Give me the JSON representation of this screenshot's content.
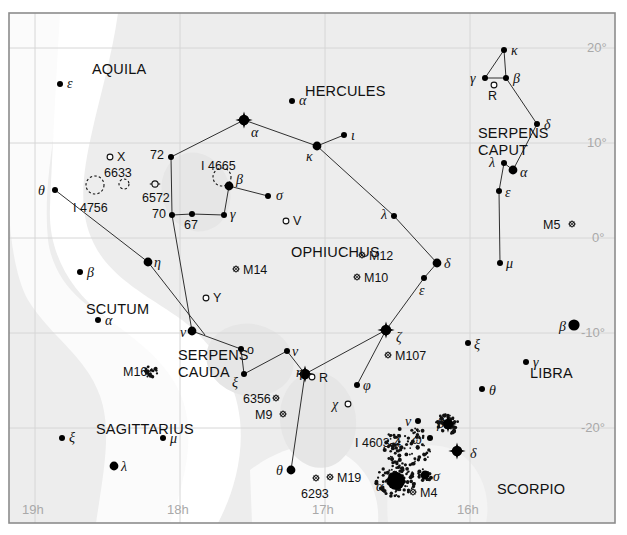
{
  "chart_data": {
    "type": "scatter",
    "xlabel": "Right Ascension",
    "ylabel": "Declination",
    "xlim": [
      19.4,
      15.55
    ],
    "ylim": [
      -24,
      23
    ],
    "grid": true,
    "legend": "none",
    "ra_ticks": [
      "19h",
      "18h",
      "17h",
      "16h"
    ],
    "ra_tick_values": [
      19,
      18,
      17,
      16
    ],
    "dec_ticks": [
      "20°",
      "10°",
      "0°",
      "-10°",
      "-20°"
    ],
    "dec_tick_values": [
      20,
      10,
      0,
      -10,
      -20
    ],
    "constellation_names": [
      {
        "name": "AQUILA",
        "x": 92,
        "y": 62
      },
      {
        "name": "HERCULES",
        "x": 305,
        "y": 84
      },
      {
        "name": "SERPENS",
        "x": 478,
        "y": 126
      },
      {
        "name": "CAPUT",
        "x": 478,
        "y": 143
      },
      {
        "name": "OPHIUCHUS",
        "x": 291,
        "y": 245
      },
      {
        "name": "SCUTUM",
        "x": 86,
        "y": 302
      },
      {
        "name": "SERPENS",
        "x": 178,
        "y": 348
      },
      {
        "name": "CAUDA",
        "x": 178,
        "y": 365
      },
      {
        "name": "SAGITTARIUS",
        "x": 96,
        "y": 422
      },
      {
        "name": "LIBRA",
        "x": 530,
        "y": 366
      },
      {
        "name": "SCORPIO",
        "x": 497,
        "y": 482
      }
    ],
    "stars": [
      {
        "label": "ε",
        "const": "Aquila",
        "x": 60,
        "y": 84,
        "mag": 3.0,
        "style": "dot",
        "lx": 67,
        "ly": 77,
        "type": "greek"
      },
      {
        "label": "α",
        "const": "Hercules",
        "x": 292,
        "y": 101,
        "mag": 3.0,
        "style": "dot",
        "lx": 299,
        "ly": 94,
        "type": "greek"
      },
      {
        "label": "α",
        "const": "Ophiuchus",
        "x": 244,
        "y": 120,
        "mag": 2.1,
        "style": "bright",
        "lx": 251,
        "ly": 126,
        "type": "greek"
      },
      {
        "label": "κ",
        "const": "Ophiuchus",
        "x": 317,
        "y": 146,
        "mag": 3.2,
        "style": "med",
        "lx": 306,
        "ly": 150,
        "type": "greek"
      },
      {
        "label": "ι",
        "const": "Ophiuchus",
        "x": 344,
        "y": 135,
        "mag": 3.5,
        "style": "dot",
        "lx": 351,
        "ly": 129,
        "type": "greek"
      },
      {
        "label": "72",
        "const": "Ophiuchus",
        "x": 171,
        "y": 157,
        "mag": 4.0,
        "style": "dot",
        "lx": 150,
        "ly": 149,
        "type": "num"
      },
      {
        "label": "β",
        "const": "Ophiuchus",
        "x": 229,
        "y": 186,
        "mag": 2.8,
        "style": "med",
        "lx": 236,
        "ly": 173,
        "type": "greek"
      },
      {
        "label": "σ",
        "const": "Ophiuchus",
        "x": 268,
        "y": 196,
        "mag": 4.3,
        "style": "dot",
        "lx": 276,
        "ly": 189,
        "type": "greek"
      },
      {
        "label": "γ",
        "const": "Ophiuchus",
        "x": 224,
        "y": 215,
        "mag": 3.7,
        "style": "dot",
        "lx": 230,
        "ly": 208,
        "type": "greek"
      },
      {
        "label": "70",
        "const": "Ophiuchus",
        "x": 172,
        "y": 215,
        "mag": 4.0,
        "style": "dot",
        "lx": 152,
        "ly": 208,
        "type": "num"
      },
      {
        "label": "67",
        "const": "Ophiuchus",
        "x": 192,
        "y": 214,
        "mag": 4.0,
        "style": "dot",
        "lx": 184,
        "ly": 219,
        "type": "num"
      },
      {
        "label": "θ",
        "const": "Serpens",
        "x": 55,
        "y": 190,
        "mag": 4.0,
        "style": "dot",
        "lx": 38,
        "ly": 184,
        "type": "greek"
      },
      {
        "label": "λ",
        "const": "Ophiuchus",
        "x": 394,
        "y": 216,
        "mag": 3.8,
        "style": "dot",
        "lx": 381,
        "ly": 208,
        "type": "greek"
      },
      {
        "label": "δ",
        "const": "Ophiuchus",
        "x": 437,
        "y": 263,
        "mag": 2.7,
        "style": "med",
        "lx": 444,
        "ly": 257,
        "type": "greek"
      },
      {
        "label": "ε",
        "const": "Ophiuchus",
        "x": 424,
        "y": 278,
        "mag": 3.2,
        "style": "dot",
        "lx": 419,
        "ly": 284,
        "type": "greek"
      },
      {
        "label": "ζ",
        "const": "Ophiuchus",
        "x": 386,
        "y": 330,
        "mag": 2.5,
        "style": "bright",
        "lx": 396,
        "ly": 331,
        "type": "greek"
      },
      {
        "label": "η",
        "const": "Ophiuchus",
        "x": 148,
        "y": 262,
        "mag": 3.0,
        "style": "med",
        "lx": 154,
        "ly": 256,
        "type": "greek"
      },
      {
        "label": "ν",
        "const": "Serpens",
        "x": 192,
        "y": 331,
        "mag": 3.0,
        "style": "med",
        "lx": 180,
        "ly": 326,
        "type": "greek"
      },
      {
        "label": "o",
        "const": "Serpens",
        "x": 241,
        "y": 349,
        "mag": 4.2,
        "style": "dot",
        "lx": 247,
        "ly": 344,
        "type": "plain"
      },
      {
        "label": "ν",
        "const": "Serpens2",
        "x": 287,
        "y": 351,
        "mag": 4.2,
        "style": "dot",
        "lx": 292,
        "ly": 345,
        "type": "greek"
      },
      {
        "label": "ξ",
        "const": "Serpens",
        "x": 244,
        "y": 374,
        "mag": 3.5,
        "style": "dot",
        "lx": 232,
        "ly": 376,
        "type": "greek"
      },
      {
        "label": "η",
        "const": "Serpens-eta",
        "x": 305,
        "y": 374,
        "mag": 2.4,
        "style": "bright",
        "lx": 296,
        "ly": 366,
        "type": "greek"
      },
      {
        "label": "β",
        "const": "Scutum",
        "x": 80,
        "y": 272,
        "mag": 4.2,
        "style": "dot",
        "lx": 87,
        "ly": 266,
        "type": "greek"
      },
      {
        "label": "α",
        "const": "Scutum",
        "x": 98,
        "y": 320,
        "mag": 3.8,
        "style": "dot",
        "lx": 105,
        "ly": 314,
        "type": "greek"
      },
      {
        "label": "ξ",
        "const": "Sagittarius",
        "x": 62,
        "y": 438,
        "mag": 3.5,
        "style": "dot",
        "lx": 69,
        "ly": 431,
        "type": "greek"
      },
      {
        "label": "μ",
        "const": "Sagittarius",
        "x": 163,
        "y": 438,
        "mag": 3.8,
        "style": "dot",
        "lx": 170,
        "ly": 432,
        "type": "greek"
      },
      {
        "label": "λ",
        "const": "Sagittarius",
        "x": 114,
        "y": 466,
        "mag": 2.8,
        "style": "med",
        "lx": 121,
        "ly": 460,
        "type": "greek"
      },
      {
        "label": "θ",
        "const": "Ophiuchus-th",
        "x": 291,
        "y": 470,
        "mag": 3.3,
        "style": "med",
        "lx": 276,
        "ly": 464,
        "type": "greek"
      },
      {
        "label": "φ",
        "const": "Ophiuchus-phi",
        "x": 357,
        "y": 385,
        "mag": 4.3,
        "style": "dot",
        "lx": 363,
        "ly": 379,
        "type": "greek"
      },
      {
        "label": "χ",
        "const": "Ophiuchus-chi",
        "x": 348,
        "y": 404,
        "mag": 4.4,
        "style": "open",
        "lx": 332,
        "ly": 398,
        "type": "greek"
      },
      {
        "label": "κ",
        "const": "Serpens Caput",
        "x": 504,
        "y": 50,
        "mag": 4.1,
        "style": "dot",
        "lx": 511,
        "ly": 44,
        "type": "greek"
      },
      {
        "label": "γ",
        "const": "Serpens Caput",
        "x": 485,
        "y": 78,
        "mag": 3.8,
        "style": "dot",
        "lx": 470,
        "ly": 72,
        "type": "greek"
      },
      {
        "label": "β",
        "const": "Serpens Caput",
        "x": 506,
        "y": 78,
        "mag": 3.7,
        "style": "dot",
        "lx": 513,
        "ly": 72,
        "type": "greek"
      },
      {
        "label": "R",
        "const": "Serpens Caput",
        "x": 494,
        "y": 85,
        "mag": 5.0,
        "style": "open",
        "lx": 488,
        "ly": 90,
        "type": "plain"
      },
      {
        "label": "δ",
        "const": "Serpens Caput",
        "x": 537,
        "y": 124,
        "mag": 3.8,
        "style": "dot",
        "lx": 544,
        "ly": 118,
        "type": "greek"
      },
      {
        "label": "λ",
        "const": "Serpens Caput",
        "x": 504,
        "y": 163,
        "mag": 4.4,
        "style": "dot",
        "lx": 489,
        "ly": 156,
        "type": "greek"
      },
      {
        "label": "α",
        "const": "Serpens Caput",
        "x": 513,
        "y": 170,
        "mag": 2.6,
        "style": "med",
        "lx": 520,
        "ly": 166,
        "type": "greek"
      },
      {
        "label": "ε",
        "const": "Serpens Caput",
        "x": 499,
        "y": 191,
        "mag": 3.7,
        "style": "dot",
        "lx": 505,
        "ly": 186,
        "type": "greek"
      },
      {
        "label": "μ",
        "const": "Serpens Caput",
        "x": 500,
        "y": 263,
        "mag": 3.5,
        "style": "dot",
        "lx": 506,
        "ly": 257,
        "type": "greek"
      },
      {
        "label": "β",
        "const": "Libra",
        "x": 574,
        "y": 325,
        "mag": 2.6,
        "style": "big",
        "lx": 559,
        "ly": 320,
        "type": "greek"
      },
      {
        "label": "ξ",
        "const": "Libra-xi",
        "x": 468,
        "y": 343,
        "mag": 4.4,
        "style": "dot",
        "lx": 474,
        "ly": 338,
        "type": "greek"
      },
      {
        "label": "γ",
        "const": "Libra",
        "x": 526,
        "y": 362,
        "mag": 3.9,
        "style": "dot",
        "lx": 533,
        "ly": 356,
        "type": "greek"
      },
      {
        "label": "θ",
        "const": "Libra-theta",
        "x": 482,
        "y": 389,
        "mag": 4.1,
        "style": "dot",
        "lx": 489,
        "ly": 384,
        "type": "greek"
      },
      {
        "label": "ν",
        "const": "Scorpio",
        "x": 418,
        "y": 421,
        "mag": 4.0,
        "style": "dot",
        "lx": 405,
        "ly": 415,
        "type": "greek"
      },
      {
        "label": "β",
        "const": "Scorpio-beta",
        "x": 448,
        "y": 424,
        "mag": 2.6,
        "style": "bright",
        "lx": 455,
        "ly": 418,
        "type": "none"
      },
      {
        "label": "ω",
        "const": "Scorpio",
        "x": 430,
        "y": 438,
        "mag": 4.0,
        "style": "dot",
        "lx": 412,
        "ly": 433,
        "type": "greek"
      },
      {
        "label": "δ",
        "const": "Scorpio",
        "x": 457,
        "y": 451,
        "mag": 2.3,
        "style": "bright",
        "lx": 470,
        "ly": 447,
        "type": "greek"
      },
      {
        "label": "α",
        "const": "Scorpio",
        "x": 396,
        "y": 481,
        "mag": 1.0,
        "style": "huge",
        "lx": 376,
        "ly": 480,
        "type": "greek"
      },
      {
        "label": "σ",
        "const": "Scorpio",
        "x": 425,
        "y": 475,
        "mag": 2.9,
        "style": "med",
        "lx": 433,
        "ly": 470,
        "type": "greek"
      }
    ],
    "variable_stars": [
      {
        "label": "X",
        "x": 110,
        "y": 157,
        "lx": 117,
        "ly": 151
      },
      {
        "label": "V",
        "x": 286,
        "y": 221,
        "lx": 293,
        "ly": 215
      },
      {
        "label": "Y",
        "x": 206,
        "y": 298,
        "lx": 213,
        "ly": 292
      },
      {
        "label": "R",
        "x": 312,
        "y": 377,
        "lx": 319,
        "ly": 372
      }
    ],
    "deep_sky": [
      {
        "label": "6633",
        "sym": "oc",
        "x": 124,
        "y": 184,
        "lx": 104,
        "ly": 167
      },
      {
        "label": "I 4756",
        "sym": "oc-big",
        "x": 95,
        "y": 185,
        "lx": 73,
        "ly": 202
      },
      {
        "label": "6572",
        "sym": "pn",
        "x": 155,
        "y": 184,
        "lx": 142,
        "ly": 192
      },
      {
        "label": "I 4665",
        "sym": "oc-big",
        "x": 222,
        "y": 177,
        "lx": 201,
        "ly": 160
      },
      {
        "label": "M5",
        "sym": "gc",
        "x": 572,
        "y": 224,
        "lx": 543,
        "ly": 219
      },
      {
        "label": "M12",
        "sym": "gc",
        "x": 362,
        "y": 255,
        "lx": 369,
        "ly": 250
      },
      {
        "label": "M10",
        "sym": "gc",
        "x": 357,
        "y": 277,
        "lx": 364,
        "ly": 272
      },
      {
        "label": "M14",
        "sym": "gc",
        "x": 236,
        "y": 269,
        "lx": 243,
        "ly": 264
      },
      {
        "label": "M16",
        "sym": "oc-neb",
        "x": 151,
        "y": 372,
        "lx": 123,
        "ly": 366
      },
      {
        "label": "M107",
        "sym": "gc",
        "x": 388,
        "y": 355,
        "lx": 395,
        "ly": 350
      },
      {
        "label": "6356",
        "sym": "gc",
        "x": 276,
        "y": 398,
        "lx": 243,
        "ly": 393
      },
      {
        "label": "M9",
        "sym": "gc",
        "x": 283,
        "y": 414,
        "lx": 255,
        "ly": 409
      },
      {
        "label": "6293",
        "sym": "gc",
        "x": 316,
        "y": 478,
        "lx": 301,
        "ly": 488
      },
      {
        "label": "M19",
        "sym": "gc",
        "x": 330,
        "y": 477,
        "lx": 337,
        "ly": 472
      },
      {
        "label": "M4",
        "sym": "gc",
        "x": 413,
        "y": 492,
        "lx": 420,
        "ly": 487
      },
      {
        "label": "I 4603-4",
        "sym": "neb",
        "x": 408,
        "y": 447,
        "lx": 355,
        "ly": 437
      }
    ],
    "constellation_lines": [
      [
        [
          244,
          120
        ],
        [
          171,
          157
        ]
      ],
      [
        [
          244,
          120
        ],
        [
          317,
          146
        ]
      ],
      [
        [
          317,
          146
        ],
        [
          344,
          135
        ]
      ],
      [
        [
          171,
          157
        ],
        [
          172,
          215
        ]
      ],
      [
        [
          229,
          186
        ],
        [
          268,
          196
        ]
      ],
      [
        [
          229,
          186
        ],
        [
          224,
          215
        ]
      ],
      [
        [
          224,
          215
        ],
        [
          192,
          214
        ]
      ],
      [
        [
          192,
          214
        ],
        [
          172,
          215
        ]
      ],
      [
        [
          172,
          215
        ],
        [
          192,
          331
        ]
      ],
      [
        [
          192,
          331
        ],
        [
          241,
          349
        ]
      ],
      [
        [
          241,
          349
        ],
        [
          244,
          374
        ]
      ],
      [
        [
          244,
          374
        ],
        [
          287,
          351
        ]
      ],
      [
        [
          287,
          351
        ],
        [
          305,
          374
        ]
      ],
      [
        [
          305,
          374
        ],
        [
          386,
          330
        ]
      ],
      [
        [
          305,
          374
        ],
        [
          291,
          470
        ]
      ],
      [
        [
          317,
          146
        ],
        [
          394,
          216
        ]
      ],
      [
        [
          394,
          216
        ],
        [
          437,
          263
        ]
      ],
      [
        [
          437,
          263
        ],
        [
          424,
          278
        ]
      ],
      [
        [
          424,
          278
        ],
        [
          386,
          330
        ]
      ],
      [
        [
          386,
          330
        ],
        [
          357,
          385
        ]
      ],
      [
        [
          55,
          190
        ],
        [
          148,
          262
        ]
      ],
      [
        [
          148,
          262
        ],
        [
          205,
          335
        ]
      ],
      [
        [
          504,
          50
        ],
        [
          485,
          78
        ]
      ],
      [
        [
          504,
          50
        ],
        [
          506,
          78
        ]
      ],
      [
        [
          485,
          78
        ],
        [
          506,
          78
        ]
      ],
      [
        [
          506,
          78
        ],
        [
          537,
          124
        ]
      ],
      [
        [
          537,
          124
        ],
        [
          513,
          170
        ]
      ],
      [
        [
          513,
          170
        ],
        [
          504,
          163
        ]
      ],
      [
        [
          504,
          163
        ],
        [
          499,
          191
        ]
      ],
      [
        [
          499,
          191
        ],
        [
          500,
          263
        ]
      ]
    ]
  },
  "axes": {
    "ra_label_1": "19h",
    "ra_label_2": "18h",
    "ra_label_3": "17h",
    "ra_label_4": "16h",
    "dec_label_1": "20°",
    "dec_label_2": "10°",
    "dec_label_3": "0°",
    "dec_label_4": "-10°",
    "dec_label_5": "-20°"
  },
  "colors": {
    "frame": "#8c8c8c",
    "grid": "#d8d8d8",
    "star": "#000000",
    "text": "#111111",
    "axis_text": "#a9a9a9",
    "milkyway_light": "#efefef",
    "milkyway_mid": "#e3e3e3",
    "background": "#ffffff"
  }
}
